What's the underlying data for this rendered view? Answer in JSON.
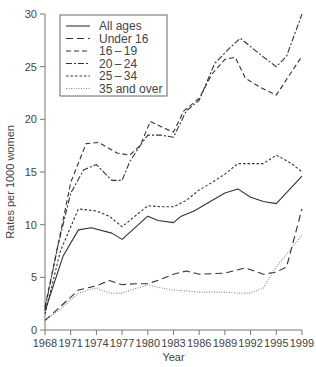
{
  "chart_data": {
    "type": "line",
    "title": "",
    "xlabel": "Year",
    "ylabel": "Rates per 1000 women",
    "ylim": [
      0,
      30
    ],
    "yticks": [
      0,
      5,
      10,
      15,
      20,
      25,
      30
    ],
    "xticks": [
      "1968",
      "1971",
      "1974",
      "1977",
      "1980",
      "1983",
      "1986",
      "1989",
      "1992",
      "1995",
      "1999"
    ],
    "grid": false,
    "legend_position": "top-left",
    "x_note": "x values are tick-index positions (0 = 1968 ... 10 = 1999), ticks evenly spaced",
    "series": [
      {
        "name": "All ages",
        "style": "solid",
        "x": [
          0,
          0.7,
          1.3,
          1.8,
          2.6,
          3.0,
          4.0,
          4.4,
          5.0,
          5.3,
          5.8,
          6.3,
          7.0,
          7.5,
          8.0,
          8.5,
          9.0,
          10.0
        ],
        "values": [
          1.8,
          7.0,
          9.5,
          9.7,
          9.2,
          8.6,
          10.8,
          10.4,
          10.2,
          10.8,
          11.3,
          12.0,
          13.0,
          13.4,
          12.6,
          12.2,
          12.0,
          14.6
        ]
      },
      {
        "name": "Under 16",
        "style": "long-dash",
        "x": [
          0,
          0.5,
          1.3,
          2.0,
          2.5,
          3.0,
          3.5,
          4.0,
          4.5,
          5.0,
          5.5,
          6.0,
          7.0,
          7.8,
          8.5,
          9.0,
          9.4,
          10.0
        ],
        "values": [
          0.9,
          2.0,
          3.8,
          4.2,
          4.7,
          4.3,
          4.4,
          4.4,
          4.8,
          5.3,
          5.6,
          5.3,
          5.4,
          5.9,
          5.3,
          5.5,
          6.0,
          11.5
        ]
      },
      {
        "name": "16-19",
        "style": "dashed",
        "x": [
          0,
          0.5,
          1.0,
          1.6,
          2.1,
          2.8,
          3.3,
          3.7,
          4.1,
          4.6,
          5.0,
          5.4,
          6.0,
          6.5,
          7.0,
          7.4,
          7.8,
          8.4,
          9.0,
          10.0
        ],
        "values": [
          2.2,
          8.0,
          14.0,
          17.7,
          17.8,
          16.8,
          16.6,
          17.5,
          19.8,
          19.2,
          18.8,
          20.8,
          22.0,
          24.3,
          25.7,
          25.9,
          23.9,
          23.0,
          22.3,
          26.0
        ]
      },
      {
        "name": "20-24",
        "style": "dash-dot",
        "x": [
          0,
          0.5,
          1.0,
          1.5,
          2.0,
          2.6,
          3.0,
          3.3,
          3.7,
          4.0,
          4.5,
          5.0,
          5.5,
          6.0,
          6.6,
          7.2,
          7.6,
          8.3,
          9.0,
          9.4,
          10.0
        ],
        "values": [
          2.0,
          8.0,
          13.0,
          15.2,
          15.7,
          14.2,
          14.2,
          16.0,
          17.5,
          18.5,
          18.5,
          18.3,
          20.8,
          21.8,
          25.3,
          26.8,
          27.7,
          26.3,
          25.0,
          26.0,
          30.0
        ]
      },
      {
        "name": "25-34",
        "style": "short-dash",
        "x": [
          0,
          0.6,
          1.3,
          2.0,
          2.5,
          3.0,
          3.4,
          4.0,
          4.5,
          5.0,
          5.5,
          6.0,
          6.5,
          7.0,
          7.5,
          8.0,
          8.5,
          9.0,
          9.6,
          10.0
        ],
        "values": [
          1.5,
          7.5,
          11.5,
          11.3,
          10.8,
          9.8,
          10.6,
          11.8,
          11.7,
          11.7,
          12.3,
          13.3,
          14.0,
          14.8,
          15.8,
          15.8,
          15.8,
          16.6,
          15.8,
          15.0
        ]
      },
      {
        "name": "35 and over",
        "style": "dotted",
        "x": [
          0,
          0.6,
          1.3,
          2.0,
          2.5,
          3.0,
          3.5,
          4.0,
          4.5,
          5.0,
          5.5,
          6.0,
          6.5,
          7.0,
          7.5,
          8.0,
          8.5,
          9.0,
          9.5,
          10.0
        ],
        "values": [
          0.9,
          2.0,
          3.5,
          4.0,
          3.5,
          3.5,
          3.9,
          4.3,
          4.0,
          3.8,
          3.7,
          3.6,
          3.6,
          3.6,
          3.5,
          3.5,
          4.0,
          6.0,
          7.5,
          9.0
        ]
      }
    ]
  }
}
